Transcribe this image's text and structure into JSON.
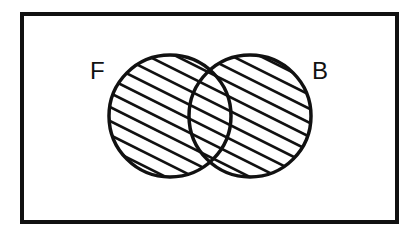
{
  "diagram": {
    "type": "venn",
    "universe": {
      "name": "universal-set",
      "label": ""
    },
    "sets": [
      {
        "id": "F",
        "label": "F"
      },
      {
        "id": "B",
        "label": "B"
      }
    ],
    "shaded_region": "F ∪ B",
    "shaded_parts": [
      "F only",
      "F ∩ B",
      "B only"
    ],
    "shading_style": "diagonal-hatch",
    "colors": {
      "ink": "#111111",
      "background": "#ffffff"
    }
  }
}
